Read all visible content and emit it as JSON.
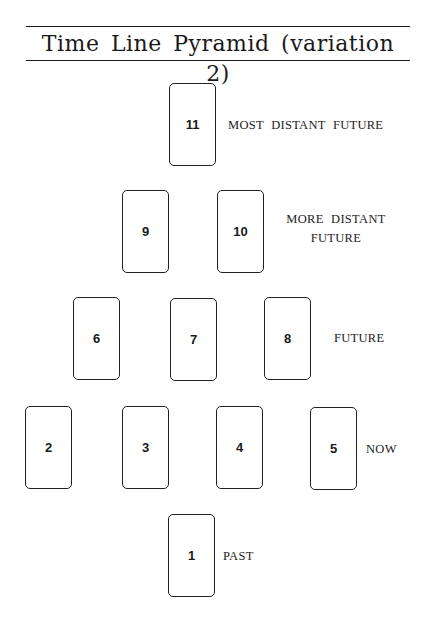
{
  "title": "Time Line Pyramid (variation 2)",
  "cards": [
    {
      "number": "1",
      "x": 168,
      "y": 514
    },
    {
      "number": "2",
      "x": 25,
      "y": 406
    },
    {
      "number": "3",
      "x": 122,
      "y": 406
    },
    {
      "number": "4",
      "x": 216,
      "y": 406
    },
    {
      "number": "5",
      "x": 310,
      "y": 406
    },
    {
      "number": "6",
      "x": 73,
      "y": 297
    },
    {
      "number": "7",
      "x": 170,
      "y": 297
    },
    {
      "number": "8",
      "x": 264,
      "y": 297
    },
    {
      "number": "9",
      "x": 122,
      "y": 190
    },
    {
      "number": "10",
      "x": 217,
      "y": 190
    },
    {
      "number": "11",
      "x": 169,
      "y": 83
    }
  ],
  "labels": {
    "most_distant_future": "MOST DISTANT FUTURE",
    "more_distant_future_line1": "MORE DISTANT",
    "more_distant_future_line2": "FUTURE",
    "future": "FUTURE",
    "now": "NOW",
    "past": "PAST"
  }
}
